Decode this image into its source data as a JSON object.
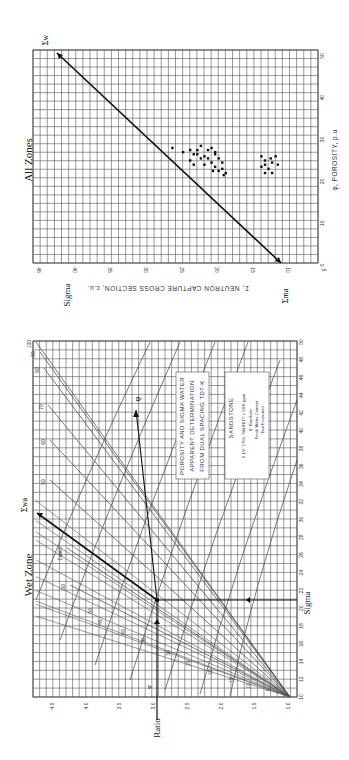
{
  "chart_data": [
    {
      "id": "all-zones",
      "type": "scatter",
      "title": "All Zones",
      "xlabel": "φ, POROSITY, p.u.",
      "ylabel": "Σ, NEUTRON CAPTURE CROSS SECTION, c.u.",
      "side_label": "Sigma",
      "xlim": [
        0,
        50
      ],
      "ylim": [
        5,
        45
      ],
      "x_ticks": [
        "0",
        "10",
        "20",
        "30",
        "40",
        "50"
      ],
      "y_ticks": [
        "5",
        "10",
        "15",
        "20",
        "25",
        "30",
        "35",
        "40",
        "45"
      ],
      "grid": true,
      "annotations": {
        "sigma_ma": "Σma",
        "sigma_w": "Σw"
      },
      "line": {
        "name": "matrix-to-water line",
        "points": [
          [
            0,
            10
          ],
          [
            50,
            42.5
          ]
        ]
      },
      "series": [
        {
          "name": "upper cluster",
          "points": [
            [
              28,
              26
            ],
            [
              27,
              24.5
            ],
            [
              27.5,
              23.5
            ],
            [
              26.5,
              22.5
            ],
            [
              26,
              21.5
            ],
            [
              27.5,
              21
            ],
            [
              28,
              20.5
            ],
            [
              26.5,
              20
            ],
            [
              25.5,
              19.5
            ],
            [
              24.5,
              19
            ],
            [
              24.5,
              20.5
            ],
            [
              25.5,
              22
            ],
            [
              26.5,
              23
            ],
            [
              27.5,
              22.5
            ],
            [
              28.5,
              22
            ],
            [
              27,
              20
            ],
            [
              25.5,
              21
            ],
            [
              24,
              21.5
            ],
            [
              23.5,
              20
            ],
            [
              22.5,
              19.5
            ],
            [
              23,
              19
            ],
            [
              22,
              18.5
            ],
            [
              21.5,
              18.8
            ],
            [
              22.5,
              20.3
            ],
            [
              24,
              23
            ],
            [
              25,
              23.5
            ]
          ]
        },
        {
          "name": "lower cluster",
          "points": [
            [
              26,
              13.5
            ],
            [
              25,
              13
            ],
            [
              24.5,
              12
            ],
            [
              24,
              13
            ],
            [
              25.5,
              12.2
            ],
            [
              26,
              11.5
            ],
            [
              24,
              11.2
            ],
            [
              23,
              12.5
            ],
            [
              23.5,
              13.5
            ],
            [
              22,
              12
            ],
            [
              22,
              13
            ]
          ]
        }
      ]
    },
    {
      "id": "wet-zone",
      "type": "line",
      "title": "Wet Zone",
      "xlabel": "Ratio",
      "ylabel": "Sigma",
      "xlim": [
        1.0,
        4.75
      ],
      "ylim": [
        10,
        50
      ],
      "x_ticks": [
        "1.0",
        "1.5",
        "2.0",
        "2.5",
        "3.0",
        "3.5",
        "4.0",
        "4.5"
      ],
      "y_ticks": [
        "10",
        "12",
        "14",
        "16",
        "18",
        "20",
        "22",
        "24",
        "26",
        "28",
        "30",
        "32",
        "34",
        "36",
        "38",
        "40",
        "42",
        "44",
        "46",
        "48",
        "50"
      ],
      "grid": true,
      "porosity_labels": [
        "5",
        "10",
        "15",
        "20",
        "25",
        "30",
        "35",
        "40",
        "45",
        "50"
      ],
      "sigma_wa_labels": [
        "30",
        "40",
        "50",
        "60",
        "70",
        "80",
        "90",
        "100"
      ],
      "annotations": {
        "phi": "φ",
        "sigma_wa": "Σwa",
        "sigma_wa_curve_label": "Σwa",
        "phi_curve_label": "φ"
      },
      "example": {
        "ratio": 3.0,
        "sigma": 21.5,
        "note": "entered at Sigma 21.5, Ratio 3.0"
      },
      "box1": [
        "POROSITY AND SIGMA WATER",
        "APPARENT DETERMINATION",
        "FROM DUAL SPACING TDT-K"
      ],
      "box2": {
        "title": "SANDSTONE",
        "lines": [
          "5 1/2\" CSG, SALINITY ≥ 50 K ppm",
          "8\" Borehole",
          "Fresh Water Cement",
          "Tool Eccentred"
        ]
      }
    }
  ],
  "labels": {
    "all_title": "All Zones",
    "all_sigma": "Sigma",
    "all_xaxis": "φ, POROSITY, p.u",
    "all_yaxis": "Σ, NEUTRON CAPTURE CROSS SECTION, c.u.",
    "sigma_ma": "Σma",
    "sigma_w": "Σw",
    "wet_title": "Wet Zone",
    "wet_sigma": "Sigma",
    "wet_ratio": "Ratio",
    "sigma_wa": "Σwa",
    "phi": "φ",
    "box1_l1": "POROSITY AND SIGMA WATER",
    "box1_l2": "APPARENT DETERMINATION",
    "box1_l3": "FROM DUAL SPACING TDT-K",
    "box2_title": "SANDSTONE",
    "box2_l1": "5 1/2\" CSG, SALINITY ≥ 50 K ppm",
    "box2_l2": "8\" Borehole",
    "box2_l3": "Fresh Water Cement",
    "box2_l4": "Tool Eccentred"
  }
}
